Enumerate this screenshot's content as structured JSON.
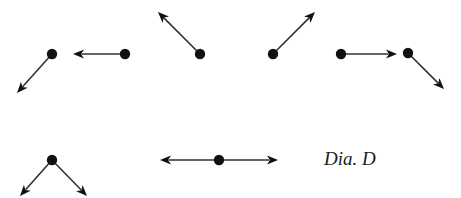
{
  "diagram": {
    "title": "Dia. D",
    "colors": {
      "ink": "#111111",
      "line": "#333333",
      "background": "#ffffff"
    },
    "groups": [
      {
        "name": "dot-arrow-down-left",
        "dot": [
          52,
          54
        ],
        "arrows": [
          [
            17,
            93
          ]
        ]
      },
      {
        "name": "dot-arrow-left",
        "dot": [
          125,
          54
        ],
        "arrows": [
          [
            73,
            54
          ]
        ]
      },
      {
        "name": "dot-arrow-up-left",
        "dot": [
          200,
          54
        ],
        "arrows": [
          [
            158,
            12
          ]
        ]
      },
      {
        "name": "dot-arrow-up-right",
        "dot": [
          273,
          54
        ],
        "arrows": [
          [
            315,
            12
          ]
        ]
      },
      {
        "name": "dot-arrow-right",
        "dot": [
          341,
          54
        ],
        "arrows": [
          [
            397,
            54
          ]
        ]
      },
      {
        "name": "dot-arrow-down-right",
        "dot": [
          408,
          53
        ],
        "arrows": [
          [
            444,
            89
          ]
        ]
      },
      {
        "name": "dot-arrows-split-down",
        "dot": [
          52,
          160
        ],
        "arrows": [
          [
            20,
            196
          ],
          [
            87,
            196
          ]
        ]
      },
      {
        "name": "dot-arrows-horizontal-both",
        "dot": [
          219,
          160
        ],
        "arrows": [
          [
            160,
            160
          ],
          [
            278,
            160
          ]
        ]
      }
    ]
  }
}
